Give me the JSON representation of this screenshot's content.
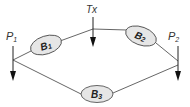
{
  "diagram": {
    "nodes": {
      "P1": {
        "label": "P",
        "sub": "1"
      },
      "P2": {
        "label": "P",
        "sub": "2"
      },
      "Tx": {
        "label": "Tx"
      },
      "B1": {
        "label": "B",
        "sub": "1"
      },
      "B2": {
        "label": "B",
        "sub": "2"
      },
      "B3": {
        "label": "B",
        "sub": "3"
      }
    },
    "edges": [
      {
        "from": "P1",
        "to": "B1"
      },
      {
        "from": "B1",
        "to": "Tx"
      },
      {
        "from": "Tx",
        "to": "B2"
      },
      {
        "from": "B2",
        "to": "P2"
      },
      {
        "from": "P1",
        "to": "B3"
      },
      {
        "from": "B3",
        "to": "P2"
      }
    ],
    "colors": {
      "line": "#555555",
      "ellipse_fill": "#e6e6e6",
      "ellipse_stroke": "#555555",
      "arrow": "#111111"
    }
  }
}
